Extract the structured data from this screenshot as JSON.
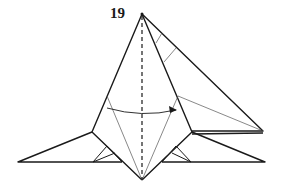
{
  "diagram": {
    "step_number": "19",
    "colors": {
      "line": "#1a1a1a",
      "thin_line": "#555555",
      "background": "#ffffff"
    },
    "annotations": {
      "valley_fold": "vertical dashed center line",
      "arrow": "curved arrow pointing right (fold left flap over to right)"
    }
  }
}
